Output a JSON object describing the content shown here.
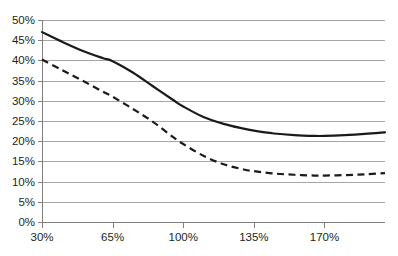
{
  "chart_data": {
    "type": "line",
    "title": "",
    "subtitle": "",
    "xlabel": "",
    "ylabel": "",
    "xlim": [
      30,
      200
    ],
    "ylim": [
      0,
      50
    ],
    "grid": true,
    "legend": "none",
    "x_tick_labels": [
      "30%",
      "65%",
      "100%",
      "135%",
      "170%"
    ],
    "x_tick_values": [
      30,
      65,
      100,
      135,
      170
    ],
    "y_tick_labels": [
      "0%",
      "5%",
      "10%",
      "15%",
      "20%",
      "25%",
      "30%",
      "35%",
      "40%",
      "45%",
      "50%"
    ],
    "y_tick_values": [
      0,
      5,
      10,
      15,
      20,
      25,
      30,
      35,
      40,
      45,
      50
    ],
    "x": [
      30,
      40,
      50,
      60,
      65,
      75,
      85,
      95,
      100,
      110,
      120,
      130,
      135,
      145,
      155,
      165,
      170,
      180,
      190,
      200
    ],
    "series": [
      {
        "name": "solid-series",
        "style": "solid",
        "color": "#1a1a1a",
        "values": [
          47.0,
          44.6,
          42.4,
          40.6,
          39.8,
          37.0,
          33.6,
          30.2,
          28.6,
          26.0,
          24.3,
          23.1,
          22.6,
          21.9,
          21.5,
          21.3,
          21.3,
          21.5,
          21.8,
          22.2
        ]
      },
      {
        "name": "dashed-series",
        "style": "dashed",
        "color": "#1a1a1a",
        "values": [
          40.2,
          37.6,
          35.0,
          32.3,
          31.0,
          28.0,
          24.8,
          21.0,
          19.3,
          16.4,
          14.3,
          13.0,
          12.6,
          12.0,
          11.7,
          11.5,
          11.5,
          11.6,
          11.8,
          12.1
        ]
      }
    ]
  },
  "plot_geometry": {
    "left": 42,
    "right": 385,
    "top": 20,
    "bottom": 222
  }
}
